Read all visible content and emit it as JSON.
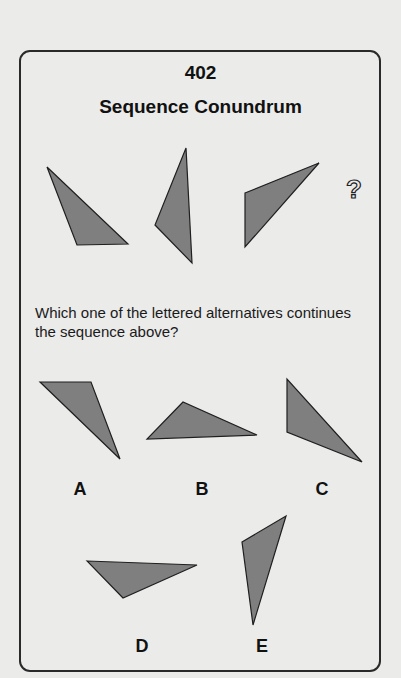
{
  "puzzle": {
    "number": "402",
    "title": "Sequence Conundrum",
    "question": "Which one of the lettered alternatives continues the sequence above?",
    "missing_marker": "?",
    "colors": {
      "background": "#ebebea",
      "shape_fill": "#7f7f7f",
      "shape_stroke": "#1f1f1f",
      "border": "#2a2a2a"
    },
    "sequence": [
      {
        "id": "seq-1",
        "points": "47,167 77,245 128,244"
      },
      {
        "id": "seq-2",
        "points": "186,148 155,225 192,263"
      },
      {
        "id": "seq-3",
        "points": "245,193 319,163 245,247"
      }
    ],
    "options": [
      {
        "letter": "A",
        "points": "40,382 91,382 120,459"
      },
      {
        "letter": "B",
        "points": "183,402 147,439 257,435"
      },
      {
        "letter": "C",
        "points": "287,379 287,432 362,462"
      },
      {
        "letter": "D",
        "points": "87,561 197,565 123,598"
      },
      {
        "letter": "E",
        "points": "242,542 286,516 253,625"
      }
    ]
  }
}
